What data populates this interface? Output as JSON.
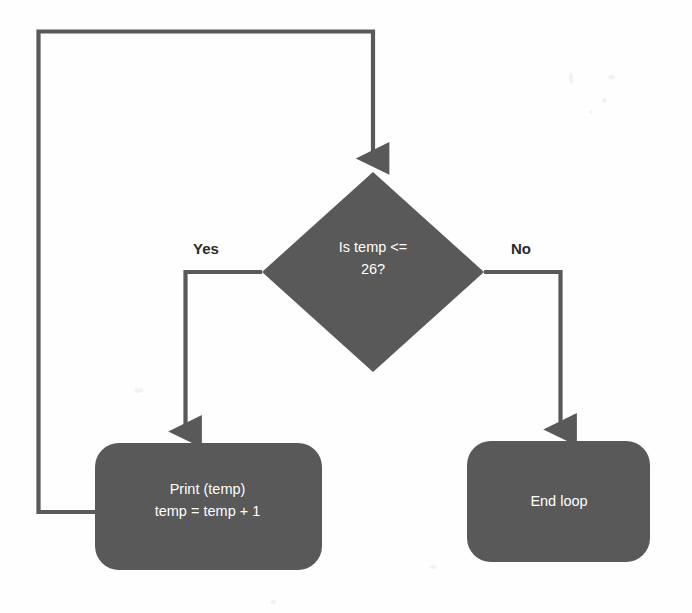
{
  "diagram": {
    "type": "flowchart",
    "colors": {
      "node_fill": "#595959",
      "node_text": "#ffffff",
      "connector": "#595959",
      "label_text": "#2b2b2b",
      "background": "#fefefe"
    },
    "nodes": [
      {
        "id": "decision",
        "shape": "diamond",
        "label": "Is temp <= 26?",
        "label_line1": "Is temp <=",
        "label_line2": "26?"
      },
      {
        "id": "process",
        "shape": "rounded-rectangle",
        "label": "Print (temp)\ntemp = temp + 1",
        "label_line1": "Print (temp)",
        "label_line2": "temp = temp + 1"
      },
      {
        "id": "terminal",
        "shape": "rounded-rectangle",
        "label": "End loop"
      }
    ],
    "edges": [
      {
        "id": "yes-branch",
        "from": "decision",
        "to": "process",
        "label": "Yes"
      },
      {
        "id": "no-branch",
        "from": "decision",
        "to": "terminal",
        "label": "No"
      },
      {
        "id": "loop-back",
        "from": "process",
        "to": "decision",
        "label": ""
      }
    ]
  }
}
